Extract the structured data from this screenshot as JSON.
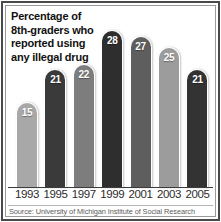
{
  "title_lines": [
    "Percentage of",
    "8th-graders who",
    "reported using",
    "any illegal drug"
  ],
  "source": "Source: University of Michigan Institute of Social Research",
  "chart_data": {
    "type": "bar",
    "title": "Percentage of 8th-graders who reported using any illegal drug",
    "xlabel": "",
    "ylabel": "",
    "ylim": [
      0,
      30
    ],
    "grid": false,
    "legend": "none",
    "categories": [
      "1993",
      "1995",
      "1997",
      "1999",
      "2001",
      "2003",
      "2005"
    ],
    "values": [
      15,
      21,
      22,
      28,
      27,
      25,
      21
    ],
    "value_labels": [
      "15",
      "21",
      "22",
      "28",
      "27",
      "25",
      "21"
    ],
    "bar_colors": [
      "#a8a8a8",
      "#3a3a3a",
      "#7d7d7d",
      "#2e2e2e",
      "#5e5e5e",
      "#9c9c9c",
      "#333333"
    ],
    "label_color": "#ffffff",
    "annotations": []
  }
}
